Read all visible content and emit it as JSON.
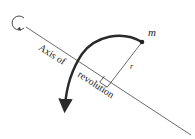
{
  "diagram": {
    "labels": {
      "mass": "m",
      "radius": "r",
      "axis_line1": "Axis of",
      "axis_line2": "revolution"
    },
    "colors": {
      "line": "#333333",
      "arc": "#2a2a2a",
      "background": "#ffffff"
    },
    "elements": [
      {
        "id": "axis-line",
        "description": "Straight diagonal axis of revolution"
      },
      {
        "id": "rotation-loop",
        "description": "Small circular arrow at upper-left end of axis indicating rotation"
      },
      {
        "id": "mass-point",
        "description": "Point mass m"
      },
      {
        "id": "radius-line",
        "description": "Perpendicular distance r from axis to mass"
      },
      {
        "id": "right-angle-marker",
        "description": "Square marking 90° between r and axis"
      },
      {
        "id": "motion-arc",
        "description": "Thick curved arrow showing path of m around axis"
      }
    ]
  }
}
